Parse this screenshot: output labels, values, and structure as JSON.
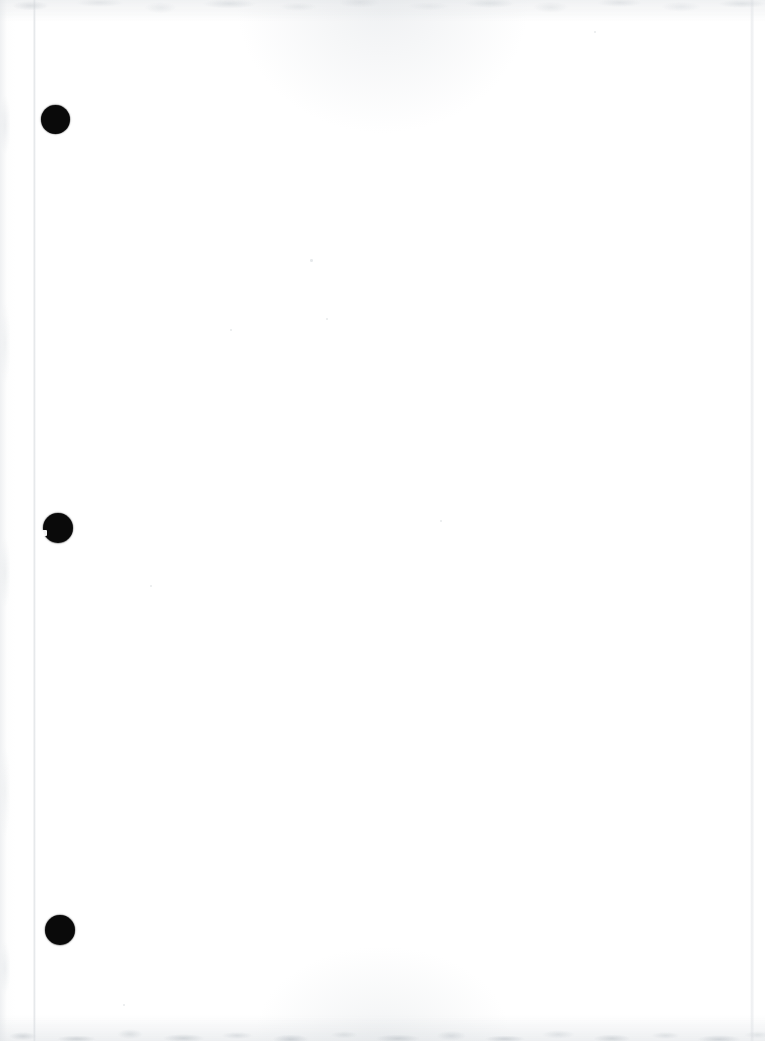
{
  "document": {
    "kind": "scanned-blank-page",
    "title": "Scanned Blank Page",
    "caption": "",
    "body_text": "",
    "width_px": 765,
    "height_px": 1041,
    "background_color": "#ffffff",
    "ink_color": "#0a0a0a"
  },
  "artifacts": {
    "fold_line": {
      "name": "vertical-fold-line",
      "x_px": 34,
      "color": "#dde0e3"
    },
    "page_edge_right": {
      "name": "right-page-edge",
      "x_px": 750,
      "color": "#e6e8eb"
    },
    "noise_top": {
      "name": "top-scan-noise-band",
      "height_px": 26,
      "color": "#d4d8db"
    },
    "noise_bottom": {
      "name": "bottom-scan-noise-band",
      "height_px": 34,
      "color": "#c2c8cd"
    }
  },
  "punch_holes": [
    {
      "label": "top-punch-hole",
      "cx": 55,
      "cy": 119,
      "r": 14.5,
      "notch": false
    },
    {
      "label": "middle-punch-hole",
      "cx": 58,
      "cy": 528,
      "r": 15.0,
      "notch": true
    },
    {
      "label": "bottom-punch-hole",
      "cx": 59.5,
      "cy": 930,
      "r": 15.0,
      "notch": false
    }
  ],
  "specks": [
    {
      "x": 310,
      "y": 259,
      "size": 2.5
    },
    {
      "x": 326,
      "y": 318,
      "size": 2.0
    },
    {
      "x": 230,
      "y": 329,
      "size": 2.0
    },
    {
      "x": 440,
      "y": 520,
      "size": 2.0
    },
    {
      "x": 150,
      "y": 585,
      "size": 2.0
    },
    {
      "x": 594,
      "y": 31,
      "size": 2.0
    },
    {
      "x": 123,
      "y": 1004,
      "size": 2.0
    }
  ]
}
